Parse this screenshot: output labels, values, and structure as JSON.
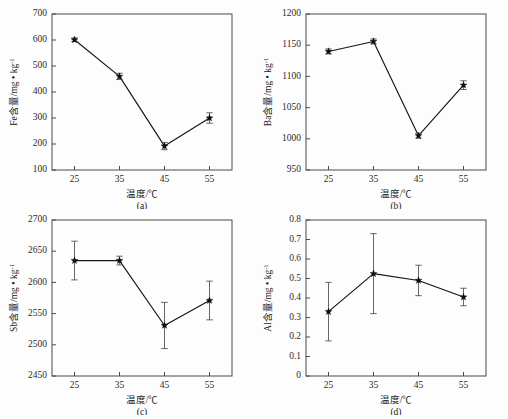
{
  "figure": {
    "name": "element-content-vs-temperature-panels",
    "background": "#fdfdfd",
    "line_color": "#141414",
    "marker_color": "#0d0d0d",
    "axis_color": "#4a4a4a",
    "errorbar_color": "#555555"
  },
  "common": {
    "xlabel_prefix": "温度/",
    "xlabel_unit": "℃",
    "xlabel": "温度/℃",
    "unit_numer": "/mg",
    "unit_dot": "•",
    "unit_kg": "kg",
    "unit_exp": "-1",
    "xticks": [
      "25",
      "35",
      "45",
      "55"
    ],
    "x_values": [
      25,
      35,
      45,
      55
    ],
    "xlim": [
      20,
      60
    ]
  },
  "chart_data": [
    {
      "id": "a",
      "type": "line",
      "caption": "(a)",
      "title": "",
      "element": "Fe",
      "ylabel_prefix": "Fe含量",
      "ylabel": "Fe含量/mg • kg-1",
      "xlabel": "温度/℃",
      "categories": [
        "25",
        "35",
        "45",
        "55"
      ],
      "x": [
        25,
        35,
        45,
        55
      ],
      "values": [
        601,
        460,
        192,
        300
      ],
      "errors": [
        7,
        12,
        14,
        20
      ],
      "yticks": [
        "100",
        "200",
        "300",
        "400",
        "500",
        "600",
        "700"
      ],
      "ytick_values": [
        100,
        200,
        300,
        400,
        500,
        600,
        700
      ],
      "ylim": [
        100,
        700
      ],
      "grid": false,
      "legend": "none"
    },
    {
      "id": "b",
      "type": "line",
      "caption": "(b)",
      "title": "",
      "element": "Ba",
      "ylabel_prefix": "Ba含量",
      "ylabel": "Ba含量/mg • kg-1",
      "xlabel": "温度/℃",
      "categories": [
        "25",
        "35",
        "45",
        "55"
      ],
      "x": [
        25,
        35,
        45,
        55
      ],
      "values": [
        1140,
        1156,
        1005,
        1086
      ],
      "errors": [
        4,
        4,
        4,
        7
      ],
      "yticks": [
        "950",
        "1000",
        "1050",
        "1100",
        "1150",
        "1200"
      ],
      "ytick_values": [
        950,
        1000,
        1050,
        1100,
        1150,
        1200
      ],
      "ylim": [
        950,
        1200
      ],
      "grid": false,
      "legend": "none"
    },
    {
      "id": "c",
      "type": "line",
      "caption": "(c)",
      "title": "",
      "element": "Sb",
      "ylabel_prefix": "Sb含量",
      "ylabel": "Sb含量/mg • kg-1",
      "xlabel": "温度/℃",
      "categories": [
        "25",
        "35",
        "45",
        "55"
      ],
      "x": [
        25,
        35,
        45,
        55
      ],
      "values": [
        2635,
        2635,
        2531,
        2571
      ],
      "errors": [
        31,
        7,
        37,
        31
      ],
      "yticks": [
        "2450",
        "2500",
        "2550",
        "2600",
        "2650",
        "2700"
      ],
      "ytick_values": [
        2450,
        2500,
        2550,
        2600,
        2650,
        2700
      ],
      "ylim": [
        2450,
        2700
      ],
      "grid": false,
      "legend": "none"
    },
    {
      "id": "d",
      "type": "line",
      "caption": "(d)",
      "title": "",
      "element": "Al",
      "ylabel_prefix": "Al含量",
      "ylabel": "Al含量/mg • kg-1",
      "xlabel": "温度/℃",
      "categories": [
        "25",
        "35",
        "45",
        "55"
      ],
      "x": [
        25,
        35,
        45,
        55
      ],
      "values": [
        0.33,
        0.525,
        0.49,
        0.405
      ],
      "errors": [
        0.15,
        0.205,
        0.078,
        0.045
      ],
      "yticks": [
        "0",
        "0.1",
        "0.2",
        "0.3",
        "0.4",
        "0.5",
        "0.6",
        "0.7",
        "0.8"
      ],
      "ytick_values": [
        0,
        0.1,
        0.2,
        0.3,
        0.4,
        0.5,
        0.6,
        0.7,
        0.8
      ],
      "ylim": [
        0,
        0.8
      ],
      "grid": false,
      "legend": "none"
    }
  ]
}
